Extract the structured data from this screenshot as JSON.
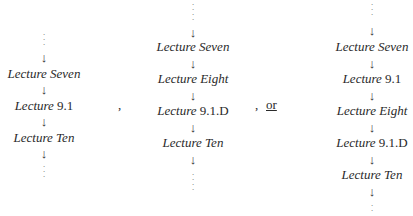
{
  "diagrams": [
    {
      "items": [
        {
          "type": "dots"
        },
        {
          "type": "arrow",
          "glyph": "↓"
        },
        {
          "type": "lecture",
          "word": "Lecture",
          "label": "Seven",
          "label_italic": true
        },
        {
          "type": "arrow",
          "glyph": "↓"
        },
        {
          "type": "lecture",
          "word": "Lecture",
          "label": "9.1",
          "label_italic": false
        },
        {
          "type": "arrow",
          "glyph": "↓"
        },
        {
          "type": "lecture",
          "word": "Lecture",
          "label": "Ten",
          "label_italic": true
        },
        {
          "type": "arrow",
          "glyph": "↓"
        },
        {
          "type": "dots"
        }
      ]
    },
    {
      "items": [
        {
          "type": "dots"
        },
        {
          "type": "arrow",
          "glyph": "↓"
        },
        {
          "type": "lecture",
          "word": "Lecture",
          "label": "Seven",
          "label_italic": true
        },
        {
          "type": "arrow",
          "glyph": "↓"
        },
        {
          "type": "lecture",
          "word": "Lecture",
          "label": "Eight",
          "label_italic": true
        },
        {
          "type": "arrow",
          "glyph": "↓"
        },
        {
          "type": "lecture",
          "word": "Lecture",
          "label": "9.1.D",
          "label_italic": false
        },
        {
          "type": "arrow",
          "glyph": "↓"
        },
        {
          "type": "lecture",
          "word": "Lecture",
          "label": "Ten",
          "label_italic": true
        },
        {
          "type": "arrow",
          "glyph": "↓"
        },
        {
          "type": "dots"
        }
      ]
    },
    {
      "items": [
        {
          "type": "dots"
        },
        {
          "type": "arrow",
          "glyph": "↓"
        },
        {
          "type": "lecture",
          "word": "Lecture",
          "label": "Seven",
          "label_italic": true
        },
        {
          "type": "arrow",
          "glyph": "↓"
        },
        {
          "type": "lecture",
          "word": "Lecture",
          "label": "9.1",
          "label_italic": false
        },
        {
          "type": "arrow",
          "glyph": "↓"
        },
        {
          "type": "lecture",
          "word": "Lecture",
          "label": "Eight",
          "label_italic": true
        },
        {
          "type": "arrow",
          "glyph": "↓"
        },
        {
          "type": "lecture",
          "word": "Lecture",
          "label": "9.1.D",
          "label_italic": false
        },
        {
          "type": "arrow",
          "glyph": "↓"
        },
        {
          "type": "lecture",
          "word": "Lecture",
          "label": "Ten",
          "label_italic": true
        },
        {
          "type": "arrow",
          "glyph": "↓"
        },
        {
          "type": "dots"
        }
      ]
    }
  ],
  "separators": {
    "comma1": ",",
    "comma2": ",",
    "or": "or"
  },
  "glyphs": {
    "vdots": "⋮",
    "arrow": "↓"
  }
}
